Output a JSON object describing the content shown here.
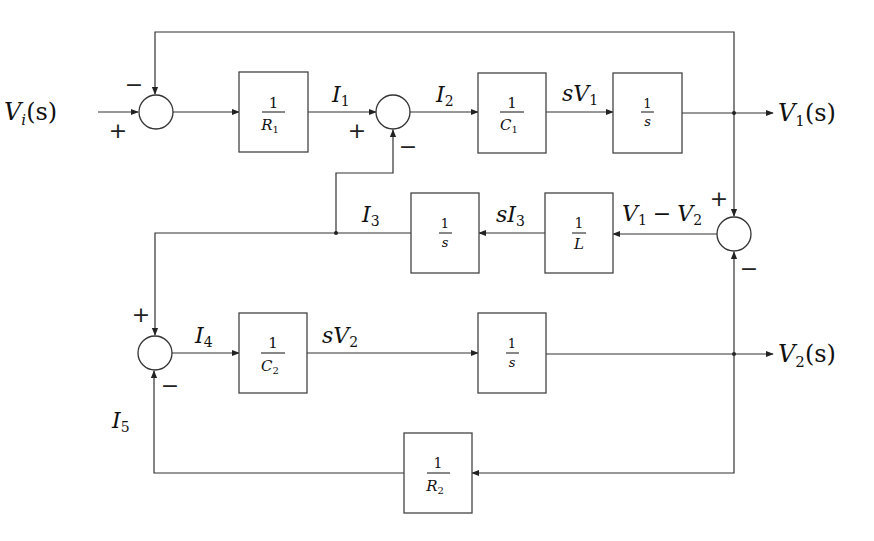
{
  "diagram": {
    "type": "block-diagram",
    "title": "",
    "inputs": [
      {
        "label": "V",
        "sub": "i",
        "tail": "(s)"
      }
    ],
    "outputs": [
      {
        "label": "V",
        "sub": "1",
        "tail": "(s)"
      },
      {
        "label": "V",
        "sub": "2",
        "tail": "(s)"
      }
    ],
    "blocks": [
      {
        "id": "R1",
        "num": "1",
        "den": "R",
        "den_sub": "1"
      },
      {
        "id": "C1",
        "num": "1",
        "den": "C",
        "den_sub": "1"
      },
      {
        "id": "int1",
        "num": "1",
        "den": "s",
        "den_sub": ""
      },
      {
        "id": "L",
        "num": "1",
        "den": "L",
        "den_sub": ""
      },
      {
        "id": "int3",
        "num": "1",
        "den": "s",
        "den_sub": ""
      },
      {
        "id": "C2",
        "num": "1",
        "den": "C",
        "den_sub": "2"
      },
      {
        "id": "int2",
        "num": "1",
        "den": "s",
        "den_sub": ""
      },
      {
        "id": "R2",
        "num": "1",
        "den": "R",
        "den_sub": "2"
      }
    ],
    "signals": {
      "I1": {
        "main": "I",
        "sub": "1"
      },
      "I2": {
        "main": "I",
        "sub": "2"
      },
      "sV1": {
        "pre": "s",
        "main": "V",
        "sub": "1"
      },
      "V1minusV2": {
        "a": "V",
        "a_sub": "1",
        "op": "−",
        "b": "V",
        "b_sub": "2"
      },
      "sI3": {
        "pre": "s",
        "main": "I",
        "sub": "3"
      },
      "I3": {
        "main": "I",
        "sub": "3"
      },
      "I4": {
        "main": "I",
        "sub": "4"
      },
      "sV2": {
        "pre": "s",
        "main": "V",
        "sub": "2"
      },
      "I5": {
        "main": "I",
        "sub": "5"
      }
    },
    "summing_junctions": [
      {
        "id": "sum1",
        "signs": {
          "left": "+",
          "top": "−"
        }
      },
      {
        "id": "sum2",
        "signs": {
          "left": "+",
          "bottom": "−"
        }
      },
      {
        "id": "sum3",
        "signs": {
          "top": "+",
          "bottom": "−"
        }
      },
      {
        "id": "sum4",
        "signs": {
          "top": "+",
          "bottom": "−"
        }
      }
    ]
  }
}
